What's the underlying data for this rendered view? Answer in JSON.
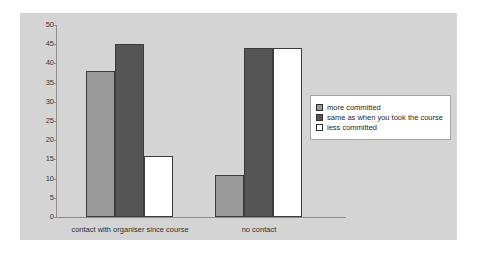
{
  "chart_data": {
    "type": "bar",
    "title": "",
    "xlabel": "",
    "ylabel": "",
    "ylim": [
      0,
      50
    ],
    "yticks": [
      0,
      5,
      10,
      15,
      20,
      25,
      30,
      35,
      40,
      45,
      50
    ],
    "grid": false,
    "legend_position": "right",
    "categories": [
      "contact with organiser since course",
      "no contact"
    ],
    "series": [
      {
        "name": "more committed",
        "color": "#9a9a9a",
        "values": [
          38,
          11
        ]
      },
      {
        "name": "same as when you took the course",
        "color": "#555555",
        "values": [
          45,
          44
        ]
      },
      {
        "name": "less committed",
        "color": "#ffffff",
        "values": [
          16,
          44
        ]
      }
    ]
  },
  "colors": {
    "plot_background": "#d4d4d4",
    "axis": "#8d8d8d",
    "bar_border": "#3c3c3c",
    "legend_border": "#a5a5a5",
    "text": "#2e2e2e"
  }
}
